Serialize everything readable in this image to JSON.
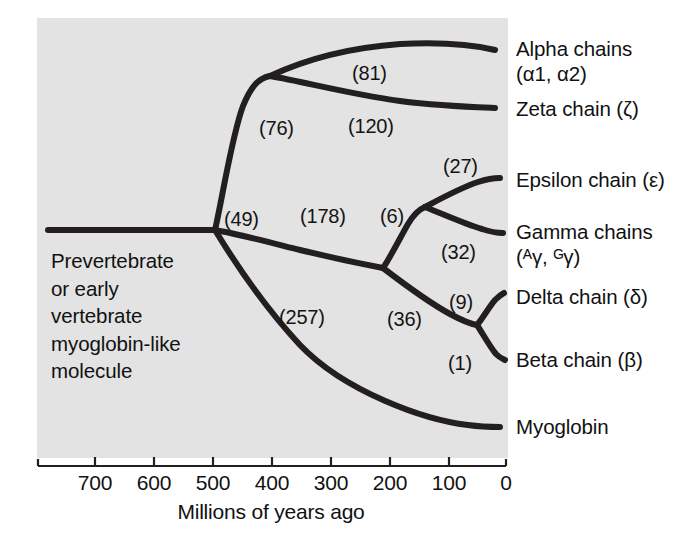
{
  "figure": {
    "type": "phylogenetic-tree",
    "panel_color": "#e3e3e3",
    "line_color": "#231f20"
  },
  "axis": {
    "title": "Millions of years ago",
    "ticks": [
      {
        "label": "700",
        "value": 700,
        "x": 95
      },
      {
        "label": "600",
        "value": 600,
        "x": 154
      },
      {
        "label": "500",
        "value": 500,
        "x": 213
      },
      {
        "label": "400",
        "value": 400,
        "x": 272
      },
      {
        "label": "300",
        "value": 300,
        "x": 331
      },
      {
        "label": "200",
        "value": 200,
        "x": 390
      },
      {
        "label": "100",
        "value": 100,
        "x": 449
      },
      {
        "label": "0",
        "value": 0,
        "x": 506
      }
    ],
    "range": [
      780,
      0
    ],
    "left_x": 38,
    "right_x": 506
  },
  "ancestor": {
    "lines": [
      "Prevertebrate",
      "or early",
      "vertebrate",
      "myoglobin-like",
      "molecule"
    ]
  },
  "branch_labels": [
    {
      "name": "alpha-zeta-split",
      "text": "(76)",
      "x": 259,
      "y": 117
    },
    {
      "name": "alpha-branch",
      "text": "(81)",
      "x": 352,
      "y": 62
    },
    {
      "name": "zeta-branch",
      "text": "(120)",
      "x": 348,
      "y": 115
    },
    {
      "name": "root-split",
      "text": "(49)",
      "x": 224,
      "y": 208
    },
    {
      "name": "beta-group-stem",
      "text": "(178)",
      "x": 300,
      "y": 205
    },
    {
      "name": "epsilon-stem",
      "text": "(6)",
      "x": 380,
      "y": 205
    },
    {
      "name": "epsilon-branch",
      "text": "(27)",
      "x": 443,
      "y": 155
    },
    {
      "name": "gamma-branch",
      "text": "(32)",
      "x": 441,
      "y": 241
    },
    {
      "name": "myoglobin-branch",
      "text": "(257)",
      "x": 279,
      "y": 306
    },
    {
      "name": "delta-beta-stem",
      "text": "(36)",
      "x": 387,
      "y": 308
    },
    {
      "name": "delta-branch",
      "text": "(9)",
      "x": 449,
      "y": 291
    },
    {
      "name": "beta-branch",
      "text": "(1)",
      "x": 448,
      "y": 352
    }
  ],
  "tips": [
    {
      "name": "alpha-chains",
      "line1": "Alpha chains",
      "line2": "(α1, α2)",
      "x": 516,
      "y": 36
    },
    {
      "name": "zeta-chain",
      "line1": "Zeta chain (ζ)",
      "line2": "",
      "x": 516,
      "y": 96
    },
    {
      "name": "epsilon-chain",
      "line1": "Epsilon chain (ε)",
      "line2": "",
      "x": 516,
      "y": 167
    },
    {
      "name": "gamma-chains",
      "line1": "Gamma chains",
      "line2": "(ᴬγ, ᴳγ)",
      "x": 516,
      "y": 219
    },
    {
      "name": "delta-chain",
      "line1": "Delta chain (δ)",
      "line2": "",
      "x": 516,
      "y": 284
    },
    {
      "name": "beta-chain",
      "line1": "Beta chain (β)",
      "line2": "",
      "x": 516,
      "y": 347
    },
    {
      "name": "myoglobin",
      "line1": "Myoglobin",
      "line2": "",
      "x": 516,
      "y": 414
    }
  ]
}
